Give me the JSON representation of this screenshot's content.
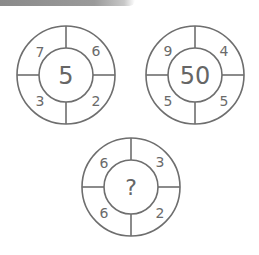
{
  "puzzle": {
    "circles": [
      {
        "center": "5",
        "top_left": "7",
        "top_right": "6",
        "bottom_left": "3",
        "bottom_right": "2"
      },
      {
        "center": "50",
        "top_left": "9",
        "top_right": "4",
        "bottom_left": "5",
        "bottom_right": "5"
      },
      {
        "center": "?",
        "top_left": "6",
        "top_right": "3",
        "bottom_left": "6",
        "bottom_right": "2"
      }
    ]
  },
  "colors": {
    "stroke": "#6e6e6e",
    "text": "#6a6a6a",
    "background": "#ffffff"
  }
}
